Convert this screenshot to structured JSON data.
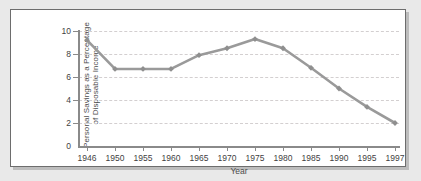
{
  "chart_data": {
    "type": "line",
    "title": "",
    "xlabel": "Year",
    "ylabel_line1": "Personal Savings as a Percentage",
    "ylabel_line2": "of Disposable Income",
    "categories": [
      "1946",
      "1950",
      "1955",
      "1960",
      "1965",
      "1970",
      "1975",
      "1980",
      "1985",
      "1990",
      "1995",
      "1997"
    ],
    "values": [
      9.2,
      6.7,
      6.7,
      6.7,
      7.9,
      8.5,
      9.3,
      8.5,
      6.8,
      5.0,
      3.4,
      2.0
    ],
    "series": [
      {
        "name": "Personal Savings as a Percentage of Disposable Income",
        "values": [
          9.2,
          6.7,
          6.7,
          6.7,
          7.9,
          8.5,
          9.3,
          8.5,
          6.8,
          5.0,
          3.4,
          2.0
        ]
      }
    ],
    "ylim": [
      0,
      10
    ],
    "ytick_labels": [
      "10",
      "8",
      "6",
      "4",
      "2",
      "0"
    ],
    "ytick_values": [
      10,
      8,
      6,
      4,
      2,
      0
    ],
    "grid": "horizontal-dashed",
    "legend": "none",
    "marker": "diamond",
    "line_color": "#9a9a9a",
    "marker_color": "#8f8f8f",
    "grid_color": "#d3cfd0",
    "axis_color": "#8a8a8a",
    "panel_background": "#ffffff",
    "page_background": "#e9e9e9"
  }
}
